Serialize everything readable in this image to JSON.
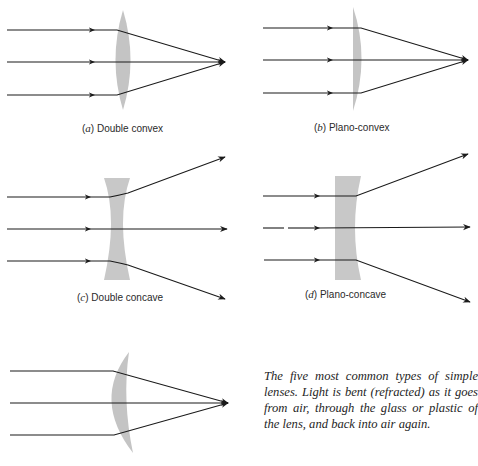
{
  "figure": {
    "panels": [
      {
        "id": "a",
        "letter": "a",
        "name": "Double convex"
      },
      {
        "id": "b",
        "letter": "b",
        "name": "Plano-convex"
      },
      {
        "id": "c",
        "letter": "c",
        "name": "Double concave"
      },
      {
        "id": "d",
        "letter": "d",
        "name": "Plano-concave"
      },
      {
        "id": "e",
        "letter": "",
        "name": ""
      }
    ],
    "caption": "The five most common types of simple lenses. Light is bent (refracted) as it goes from air, through the glass or plastic of the lens, and back into air again.",
    "colors": {
      "lens_fill": "#c4c4c4",
      "ray": "#1a1a1a",
      "background": "#ffffff"
    }
  }
}
